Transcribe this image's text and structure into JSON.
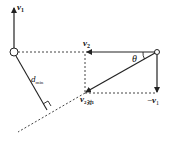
{
  "diagram": {
    "labels": {
      "v1": "v",
      "v1_sub": "1",
      "v2": "v",
      "v2_sub": "2",
      "neg_v1_prefix": "−",
      "neg_v1": "v",
      "neg_v1_sub": "1",
      "v21": "v",
      "v21_sub": "2对1",
      "theta": "θ",
      "dmin": "d",
      "dmin_sub": "min"
    },
    "colors": {
      "line": "#222222",
      "dotted": "#444444",
      "background": "#ffffff"
    }
  }
}
